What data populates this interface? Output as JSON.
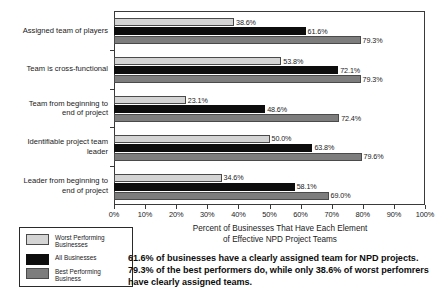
{
  "chart_data": {
    "type": "bar",
    "orientation": "horizontal",
    "title": "",
    "xlabel": "Percent of Businesses That Have Each Element of Effective NPD Project Teams",
    "ylabel": "",
    "xlim": [
      0,
      100
    ],
    "grid": false,
    "legend_position": "below-left",
    "categories": [
      "Assigned team of players",
      "Team is cross-functional",
      "Team from beginning to\nend of project",
      "Identifiable project team\nleader",
      "Leader from beginning to\nend of project"
    ],
    "xticklabels": [
      "0%",
      "10%",
      "20%",
      "30%",
      "40%",
      "50%",
      "60%",
      "70%",
      "80%",
      "90%",
      "100%"
    ],
    "xtickvalues": [
      0,
      10,
      20,
      30,
      40,
      50,
      60,
      70,
      80,
      90,
      100
    ],
    "series": [
      {
        "name": "Worst Performing Businesses",
        "color": "#d4d4d4",
        "values": [
          38.6,
          53.8,
          23.1,
          50.0,
          34.6
        ],
        "labels": [
          "38.6%",
          "53.8%",
          "23.1%",
          "50.0%",
          "34.6%"
        ]
      },
      {
        "name": "All Businesses",
        "color": "#0d0d0d",
        "values": [
          61.6,
          72.1,
          48.6,
          63.8,
          58.1
        ],
        "labels": [
          "61.6%",
          "72.1%",
          "48.6%",
          "63.8%",
          "58.1%"
        ]
      },
      {
        "name": "Best Performing Business",
        "color": "#7d7d7d",
        "values": [
          79.3,
          79.3,
          72.4,
          79.6,
          69.0
        ],
        "labels": [
          "79.3%",
          "79.3%",
          "72.4%",
          "79.6%",
          "69.0%"
        ]
      }
    ]
  },
  "axis_title": {
    "line1": "Percent of Businesses That Have Each Element",
    "line2": "of Effective NPD Project Teams"
  },
  "legend": {
    "items": [
      {
        "label": "Worst Performing\nBusinesses",
        "swatch": "worst"
      },
      {
        "label": "All Businesses",
        "swatch": "all"
      },
      {
        "label": "Best Performing\nBusiness",
        "swatch": "best"
      }
    ]
  },
  "caption": {
    "text": "61.6% of businesses have a clearly assigned team for NPD projects. 79.3% of the best performers do, while only 38.6% of worst perfomrers have clearly assigned teams."
  }
}
